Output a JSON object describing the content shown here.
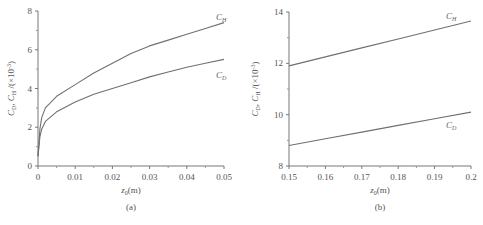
{
  "chart_data": [
    {
      "id": "a",
      "type": "line",
      "panel_label": "(a)",
      "title": "",
      "xlabel": "z0(m)",
      "ylabel": "CD, CH /(×10⁻³)",
      "xlim": [
        0,
        0.05
      ],
      "ylim": [
        0,
        8
      ],
      "xticks": [
        "0",
        "0.01",
        "0.02",
        "0.03",
        "0.04",
        "0.05"
      ],
      "yticks": [
        "0",
        "2",
        "4",
        "6",
        "8"
      ],
      "grid": false,
      "legend": "inline labels at curve ends",
      "x": [
        0,
        0.0005,
        0.001,
        0.002,
        0.005,
        0.01,
        0.015,
        0.02,
        0.025,
        0.03,
        0.035,
        0.04,
        0.045,
        0.05
      ],
      "series": [
        {
          "name": "CH",
          "values": [
            0.5,
            1.9,
            2.5,
            3.0,
            3.6,
            4.2,
            4.8,
            5.3,
            5.8,
            6.2,
            6.5,
            6.8,
            7.1,
            7.4
          ]
        },
        {
          "name": "CD",
          "values": [
            0.5,
            1.5,
            1.9,
            2.3,
            2.8,
            3.3,
            3.7,
            4.0,
            4.3,
            4.6,
            4.85,
            5.1,
            5.3,
            5.5
          ]
        }
      ]
    },
    {
      "id": "b",
      "type": "line",
      "panel_label": "(b)",
      "title": "",
      "xlabel": "z0(m)",
      "ylabel": "CD, CH /(×10⁻³)",
      "xlim": [
        0.15,
        0.2
      ],
      "ylim": [
        8,
        14
      ],
      "xticks": [
        "0.15",
        "0.16",
        "0.17",
        "0.18",
        "0.19",
        "0.2"
      ],
      "yticks": [
        "8",
        "10",
        "12",
        "14"
      ],
      "grid": false,
      "legend": "inline labels at curve ends",
      "x": [
        0.15,
        0.16,
        0.17,
        0.18,
        0.19,
        0.2
      ],
      "series": [
        {
          "name": "CH",
          "values": [
            11.9,
            12.25,
            12.6,
            12.95,
            13.3,
            13.65
          ]
        },
        {
          "name": "CD",
          "values": [
            8.8,
            9.06,
            9.32,
            9.58,
            9.84,
            10.1
          ]
        }
      ]
    }
  ],
  "labels": {
    "a": {
      "ch": "C",
      "ch_sub": "H",
      "cd": "C",
      "cd_sub": "D",
      "xlabel": "z",
      "xlabel_sub": "0",
      "xlabel_unit": "(m)",
      "panel": "(a)"
    },
    "b": {
      "ch": "C",
      "ch_sub": "H",
      "cd": "C",
      "cd_sub": "D",
      "xlabel": "z",
      "xlabel_sub": "0",
      "xlabel_unit": "(m)",
      "panel": "(b)"
    },
    "ylabel_text": "C_D, C_H /(×10⁻³)"
  }
}
